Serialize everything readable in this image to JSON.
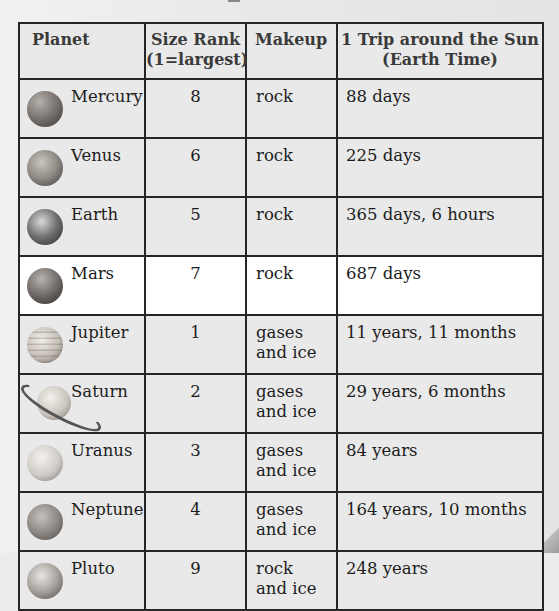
{
  "table": {
    "headers": {
      "planet": "Planet",
      "size_rank_line1": "Size Rank",
      "size_rank_line2": "(1=largest)",
      "makeup": "Makeup",
      "orbit_line1": "1 Trip around the Sun",
      "orbit_line2": "(Earth Time)"
    },
    "rows": [
      {
        "planet": "Mercury",
        "icon": "mercury-icon",
        "size_rank": "8",
        "makeup_line1": "rock",
        "makeup_line2": "",
        "orbit": "88 days"
      },
      {
        "planet": "Venus",
        "icon": "venus-icon",
        "size_rank": "6",
        "makeup_line1": "rock",
        "makeup_line2": "",
        "orbit": "225 days"
      },
      {
        "planet": "Earth",
        "icon": "earth-icon",
        "size_rank": "5",
        "makeup_line1": "rock",
        "makeup_line2": "",
        "orbit": "365 days, 6 hours"
      },
      {
        "planet": "Mars",
        "icon": "mars-icon",
        "size_rank": "7",
        "makeup_line1": "rock",
        "makeup_line2": "",
        "orbit": "687 days"
      },
      {
        "planet": "Jupiter",
        "icon": "jupiter-icon",
        "size_rank": "1",
        "makeup_line1": "gases",
        "makeup_line2": "and ice",
        "orbit": "11 years, 11 months"
      },
      {
        "planet": "Saturn",
        "icon": "saturn-icon",
        "size_rank": "2",
        "makeup_line1": "gases",
        "makeup_line2": "and ice",
        "orbit": "29 years, 6 months"
      },
      {
        "planet": "Uranus",
        "icon": "uranus-icon",
        "size_rank": "3",
        "makeup_line1": "gases",
        "makeup_line2": "and ice",
        "orbit": "84 years"
      },
      {
        "planet": "Neptune",
        "icon": "neptune-icon",
        "size_rank": "4",
        "makeup_line1": "gases",
        "makeup_line2": "and ice",
        "orbit": "164 years, 10 months"
      },
      {
        "planet": "Pluto",
        "icon": "pluto-icon",
        "size_rank": "9",
        "makeup_line1": "rock",
        "makeup_line2": "and ice",
        "orbit": "248 years"
      }
    ],
    "highlighted_row": "Mars"
  },
  "colors": {
    "page_background": "#ececec",
    "cell_background": "#e9e9e9",
    "highlight_row_background": "#ffffff",
    "border": "#262626",
    "text": "#1c1c1c"
  }
}
